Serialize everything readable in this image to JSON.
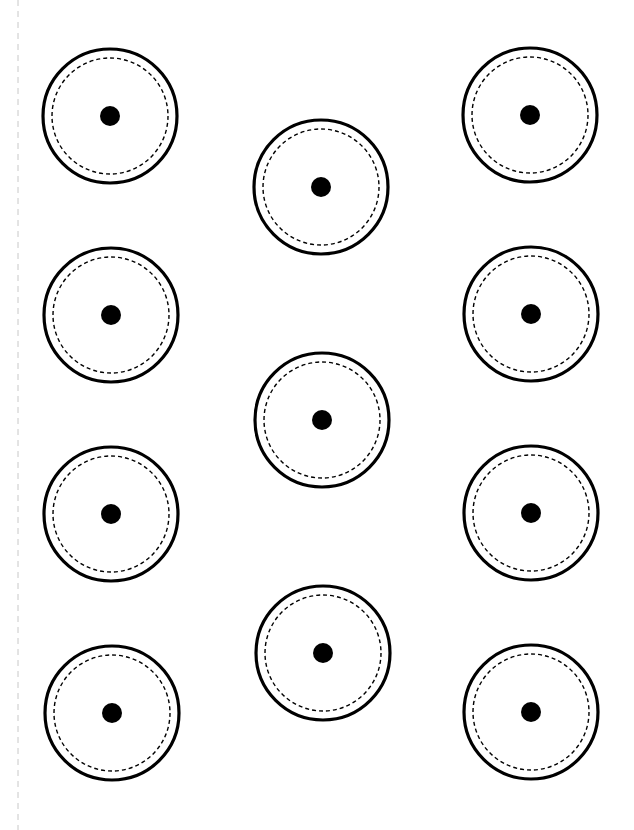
{
  "page": {
    "width": 634,
    "height": 830,
    "background": "#ffffff"
  },
  "guide_line": {
    "x": 18,
    "y1": 0,
    "y2": 830,
    "color": "#c8c8c8",
    "dash": "6 5"
  },
  "circle_style": {
    "outer_radius": 67,
    "outer_stroke": "#000000",
    "outer_stroke_width": 3.2,
    "dashed_radius": 58,
    "dashed_stroke": "#000000",
    "dashed_stroke_width": 1.4,
    "dashed_pattern": "4 3",
    "center_dot_radius": 10,
    "center_dot_fill": "#000000"
  },
  "circles": [
    {
      "id": "left-1",
      "column": "left",
      "cx": 110,
      "cy": 116
    },
    {
      "id": "left-2",
      "column": "left",
      "cx": 111,
      "cy": 315
    },
    {
      "id": "left-3",
      "column": "left",
      "cx": 111,
      "cy": 514
    },
    {
      "id": "left-4",
      "column": "left",
      "cx": 112,
      "cy": 713
    },
    {
      "id": "middle-1",
      "column": "middle",
      "cx": 321,
      "cy": 187
    },
    {
      "id": "middle-2",
      "column": "middle",
      "cx": 322,
      "cy": 420
    },
    {
      "id": "middle-3",
      "column": "middle",
      "cx": 323,
      "cy": 653
    },
    {
      "id": "right-1",
      "column": "right",
      "cx": 530,
      "cy": 115
    },
    {
      "id": "right-2",
      "column": "right",
      "cx": 531,
      "cy": 314
    },
    {
      "id": "right-3",
      "column": "right",
      "cx": 531,
      "cy": 513
    },
    {
      "id": "right-4",
      "column": "right",
      "cx": 531,
      "cy": 712
    }
  ]
}
